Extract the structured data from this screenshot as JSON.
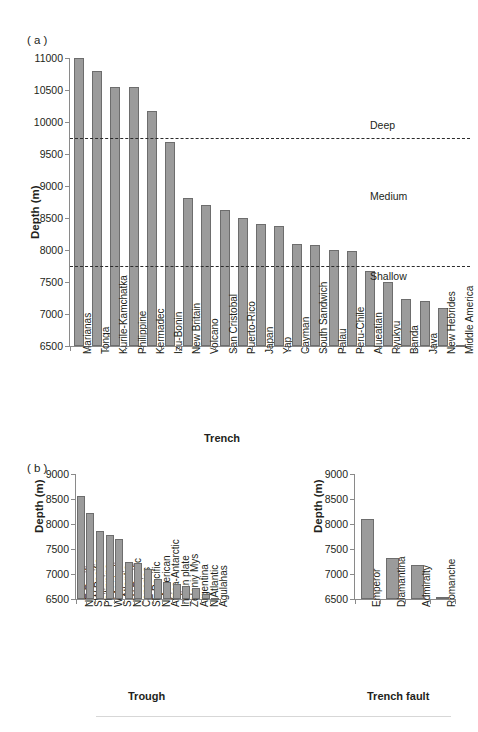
{
  "figure": {
    "panel_a_tag": "( a )",
    "panel_b_tag": "( b )"
  },
  "chart_data": [
    {
      "id": "trenches",
      "type": "bar",
      "title": "",
      "xlabel": "Trench",
      "ylabel": "Depth (m)",
      "ylim": [
        6500,
        11000
      ],
      "yticks": [
        6500,
        7000,
        7500,
        8000,
        8500,
        9000,
        9500,
        10000,
        10500,
        11000
      ],
      "grid": false,
      "categories": [
        "Marianas",
        "Tonga",
        "Kurile-Kamchatka",
        "Philippine",
        "Kermadec",
        "Izu-Bonin",
        "New Britain",
        "Volcano",
        "San Cristobal",
        "Puerto-Rico",
        "Japan",
        "Yap",
        "Cayman",
        "South Sandwich",
        "Palau",
        "Peru-Chile",
        "Alueatian",
        "Ryukyu",
        "Banda",
        "Java",
        "New Hebrides",
        "Middle America"
      ],
      "values": [
        10994,
        10800,
        10542,
        10540,
        10177,
        9695,
        8820,
        8700,
        8620,
        8500,
        8412,
        8380,
        8100,
        8080,
        8000,
        7990,
        7679,
        7507,
        7230,
        7200,
        7100,
        6519
      ],
      "annotations": [
        {
          "label": "Deep",
          "y": 9750,
          "text_y": 9950
        },
        {
          "label": "Medium",
          "y": null,
          "text_y": 8850
        },
        {
          "label": "Shallow",
          "y": 7750,
          "text_y": 7600
        }
      ],
      "reference_lines": [
        9750,
        7750
      ]
    },
    {
      "id": "troughs",
      "type": "bar",
      "title": "",
      "xlabel": "Trough",
      "ylabel": "Depth (m)",
      "ylim": [
        6500,
        9000
      ],
      "yticks": [
        6500,
        7000,
        7500,
        8000,
        8500,
        9000
      ],
      "grid": false,
      "categories": [
        "NE Pacific",
        "SW Pacific",
        "Philippine",
        "W Australian",
        "S Atlantic",
        "NW Pacific",
        "Canaries",
        "SE Pacific",
        "N American",
        "Africa-Antarctic",
        "Indian plate",
        "Zeleniy Mys",
        "Argentina",
        "N Atlantic",
        "Agulahas"
      ],
      "values": [
        8560,
        8215,
        7865,
        7780,
        7710,
        7250,
        7220,
        7100,
        6905,
        6845,
        6800,
        6765,
        6730,
        6600,
        6520
      ]
    },
    {
      "id": "trench-faults",
      "type": "bar",
      "title": "",
      "xlabel": "Trench fault",
      "ylabel": "Depth (m)",
      "ylim": [
        6500,
        9000
      ],
      "yticks": [
        6500,
        7000,
        7500,
        8000,
        8500,
        9000
      ],
      "grid": false,
      "categories": [
        "Emperor",
        "Diamantina",
        "Admiralty",
        "Romanche"
      ],
      "values": [
        8100,
        7320,
        7185,
        6550
      ]
    }
  ],
  "colors": {
    "bar_fill": "#9b9b9b",
    "bar_stroke": "#6d6d6d",
    "axis": "#8a8a8a",
    "text": "#231f20",
    "dash": "#2b2b2b"
  }
}
